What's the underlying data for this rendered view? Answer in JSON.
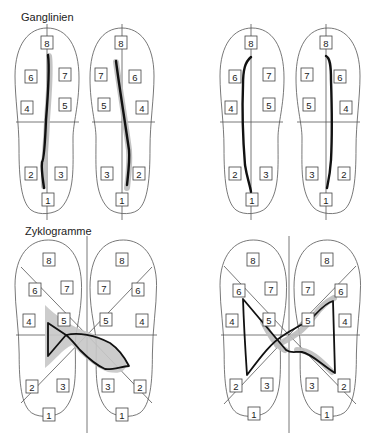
{
  "sections": {
    "ganglinien": {
      "title": "Ganglinien"
    },
    "zyklogramme": {
      "title": "Zyklogramme"
    }
  },
  "zone_labels": [
    "1",
    "2",
    "3",
    "4",
    "5",
    "6",
    "7",
    "8"
  ],
  "colors": {
    "outline": "#555555",
    "trace": "#111111",
    "halo": "#bdbdbd",
    "background": "#ffffff"
  },
  "panels": [
    {
      "id": "ganglinien-left-pair",
      "type": "gait-line",
      "position": "top-left"
    },
    {
      "id": "ganglinien-right-pair",
      "type": "gait-line",
      "position": "top-right"
    },
    {
      "id": "zyklogramme-left-pair",
      "type": "cyclogram",
      "position": "bottom-left"
    },
    {
      "id": "zyklogramme-right-pair",
      "type": "cyclogram",
      "position": "bottom-right"
    }
  ]
}
